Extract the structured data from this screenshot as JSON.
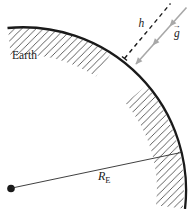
{
  "diagram": {
    "labels": {
      "earth": "Earth",
      "height": "h",
      "gravity_symbol": "g",
      "vector_arrow": "→",
      "radius_symbol": "R",
      "radius_subscript": "E"
    },
    "colors": {
      "ink": "#1a1a1a",
      "hatch": "#2b2b2b",
      "gravity_gray": "#a8a8a8",
      "background": "#ffffff"
    }
  }
}
